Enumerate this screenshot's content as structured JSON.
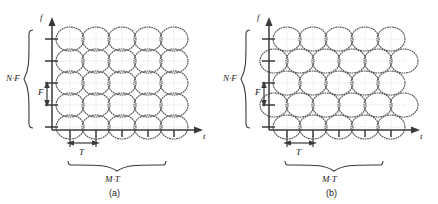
{
  "figure": {
    "type": "two-panel-diagram",
    "panels": [
      {
        "id": "a",
        "caption": "(a)",
        "lattice": "rectangular",
        "axis_x_label": "t",
        "axis_y_label": "f",
        "span_y_label": "N·F",
        "step_y_label": "F",
        "step_x_label": "T",
        "span_x_label": "M·T",
        "columns": 5,
        "rows": 5,
        "stagger": false
      },
      {
        "id": "b",
        "caption": "(b)",
        "lattice": "hexagonal-staggered",
        "axis_x_label": "t",
        "axis_y_label": "f",
        "span_y_label": "N·F",
        "step_y_label": "F",
        "step_x_label": "T",
        "span_x_label": "M·T",
        "columns": 5,
        "rows": 5,
        "stagger": true
      }
    ]
  },
  "colors": {
    "axis": "#3a3a3a",
    "ellipse": "#555555",
    "grid": "#c8c8c8",
    "text": "#222222"
  }
}
